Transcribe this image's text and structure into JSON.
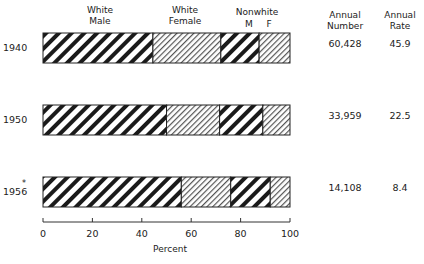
{
  "chart_data": {
    "type": "bar",
    "orientation": "horizontal-stacked-100",
    "categories": [
      "1940",
      "1950",
      "1956"
    ],
    "category_notes": {
      "1956": "*"
    },
    "series": [
      {
        "name": "White Male",
        "values": [
          44.5,
          50,
          56
        ]
      },
      {
        "name": "White Female",
        "values": [
          27.5,
          21.5,
          20
        ]
      },
      {
        "name": "Nonwhite M",
        "values": [
          15.5,
          17.5,
          16
        ]
      },
      {
        "name": "Nonwhite F",
        "values": [
          12.5,
          11,
          8
        ]
      }
    ],
    "annual_number": [
      "60,428",
      "33,959",
      "14,108"
    ],
    "annual_rate": [
      "45.9",
      "22.5",
      "8.4"
    ],
    "xlabel": "Percent",
    "xticks": [
      "0",
      "20",
      "40",
      "60",
      "80",
      "100"
    ],
    "xlim": [
      0,
      100
    ],
    "grid": false
  },
  "headers": {
    "white_male_1": "White",
    "white_male_2": "Male",
    "white_female_1": "White",
    "white_female_2": "Female",
    "nonwhite": "Nonwhite",
    "nonwhite_m": "M",
    "nonwhite_f": "F",
    "annual_number_1": "Annual",
    "annual_number_2": "Number",
    "annual_rate_1": "Annual",
    "annual_rate_2": "Rate"
  },
  "rows": [
    {
      "year": "1940",
      "number": "60,428",
      "rate": "45.9"
    },
    {
      "year": "1950",
      "number": "33,959",
      "rate": "22.5"
    },
    {
      "year": "1956",
      "marker": "*",
      "number": "14,108",
      "rate": "8.4"
    }
  ],
  "axis": {
    "label": "Percent",
    "ticks": [
      "0",
      "20",
      "40",
      "60",
      "80",
      "100"
    ]
  }
}
